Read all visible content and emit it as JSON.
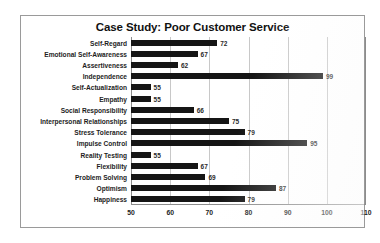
{
  "chart_data": {
    "type": "bar",
    "orientation": "horizontal",
    "title": "Case Study: Poor Customer Service",
    "xlabel": "",
    "ylabel": "",
    "xlim": [
      50,
      110
    ],
    "xticks": [
      50,
      60,
      70,
      80,
      90,
      100,
      110
    ],
    "grid": true,
    "legend": false,
    "bar_color": "#151515",
    "gridline_color": "#c8c8c8",
    "axis_color": "#8c8c8c",
    "categories": [
      "Self-Regard",
      "Emotional Self-Awareness",
      "Assertiveness",
      "Independence",
      "Self-Actualization",
      "Empathy",
      "Social Responsibility",
      "Interpersonal Relationships",
      "Stress Tolerance",
      "Impulse Control",
      "Reality Testing",
      "Flexibility",
      "Problem Solving",
      "Optimism",
      "Happiness"
    ],
    "values": [
      72,
      67,
      62,
      99,
      55,
      55,
      66,
      75,
      79,
      95,
      55,
      67,
      69,
      87,
      79
    ],
    "data_labels": [
      "72",
      "67",
      "62",
      "99",
      "55",
      "55",
      "66",
      "75",
      "79",
      "95",
      "55",
      "67",
      "69",
      "87",
      "79"
    ],
    "tick_labels": [
      "50",
      "60",
      "70",
      "80",
      "90",
      "100",
      "110"
    ]
  }
}
